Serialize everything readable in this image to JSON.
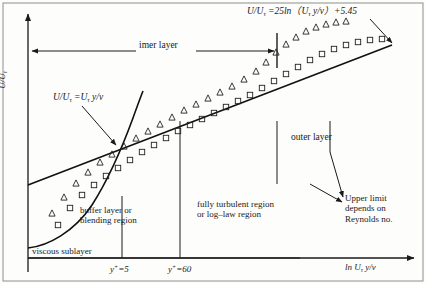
{
  "figure": {
    "axes": {
      "ylabel": "U/U",
      "ylabel_sub": "τ",
      "xlabel_pre": "ln ",
      "xlabel_var": "U",
      "xlabel_sub": "τ",
      "xlabel_post": " y/v"
    },
    "annotations": {
      "eq_log_a": "U/U",
      "eq_log_sub1": "τ",
      "eq_log_b": " =25ln（",
      "eq_log_var": "U",
      "eq_log_sub2": "τ",
      "eq_log_c": " y/v）+5.45",
      "eq_lin_a": "U/U",
      "eq_lin_sub1": "τ",
      "eq_lin_b": " =U",
      "eq_lin_sub2": "τ",
      "eq_lin_c": " y/v",
      "inner_layer": "imer layer",
      "outer_layer": "outer layer",
      "upper_limit_l1": "Upper limit",
      "upper_limit_l2": "depends on",
      "upper_limit_l3": "Reynolds no.",
      "buffer_l1": "buffer layer or",
      "buffer_l2": "blending region",
      "turbulent_l1": "fully turbulent region",
      "turbulent_l2": "or log–law region",
      "viscous_sublayer": "viscous sublayer",
      "tick_y5_pre": "y",
      "tick_y5_sup": "+",
      "tick_y5_post": "=5",
      "tick_y60_pre": "y",
      "tick_y60_sup": "+",
      "tick_y60_post": "=60"
    },
    "colors": {
      "ink": "#1a1a1a",
      "line": "#111111",
      "background": "#fdfdfb",
      "marker_stroke": "#222222"
    }
  },
  "chart_data": {
    "type": "scatter",
    "xlabel": "ln Uτ y/v",
    "ylabel": "U/Uτ",
    "grid": false,
    "legend": "none",
    "axis_note": "Schematic log-linear axes; no numeric tick values shown",
    "region_boundaries": [
      {
        "label": "y+=5",
        "x_px": 122,
        "description": "edge of viscous sublayer / start of buffer layer"
      },
      {
        "label": "y+=60",
        "x_px": 180,
        "description": "end of buffer layer / start of log-law region"
      }
    ],
    "curves": [
      {
        "name": "U/Uτ = Uτ y/v (viscous sublayer curve)",
        "style": "solid",
        "points_px": [
          [
            28,
            247
          ],
          [
            38,
            243
          ],
          [
            50,
            237
          ],
          [
            62,
            228
          ],
          [
            74,
            216
          ],
          [
            86,
            200
          ],
          [
            98,
            181
          ],
          [
            110,
            159
          ],
          [
            120,
            140
          ],
          [
            128,
            123
          ],
          [
            134,
            110
          ],
          [
            139,
            99
          ]
        ]
      },
      {
        "name": "U/Uτ = 25ln(Uτ y/v) + 5.45 (log-law line)",
        "style": "solid-straight",
        "points_px": [
          [
            28,
            185
          ],
          [
            390,
            46
          ]
        ]
      }
    ],
    "series": [
      {
        "name": "triangle-data",
        "marker": "triangle",
        "points_px": [
          [
            52,
            213
          ],
          [
            64,
            197
          ],
          [
            76,
            183
          ],
          [
            88,
            172
          ],
          [
            100,
            162
          ],
          [
            112,
            154
          ],
          [
            124,
            146
          ],
          [
            136,
            138
          ],
          [
            148,
            131
          ],
          [
            160,
            124
          ],
          [
            172,
            117
          ],
          [
            184,
            110
          ],
          [
            196,
            104
          ],
          [
            208,
            98
          ],
          [
            220,
            92
          ],
          [
            232,
            86
          ],
          [
            244,
            79
          ],
          [
            256,
            71
          ],
          [
            266,
            62
          ],
          [
            276,
            52
          ],
          [
            286,
            44
          ],
          [
            296,
            37
          ],
          [
            306,
            31
          ],
          [
            316,
            27
          ],
          [
            326,
            24
          ],
          [
            336,
            22
          ],
          [
            346,
            21
          ]
        ]
      },
      {
        "name": "square-data",
        "marker": "square",
        "points_px": [
          [
            58,
            225
          ],
          [
            70,
            208
          ],
          [
            82,
            195
          ],
          [
            94,
            185
          ],
          [
            106,
            176
          ],
          [
            118,
            168
          ],
          [
            130,
            160
          ],
          [
            142,
            152
          ],
          [
            154,
            145
          ],
          [
            166,
            138
          ],
          [
            178,
            131
          ],
          [
            190,
            125
          ],
          [
            202,
            119
          ],
          [
            214,
            113
          ],
          [
            226,
            107
          ],
          [
            238,
            101
          ],
          [
            250,
            95
          ],
          [
            262,
            88
          ],
          [
            274,
            81
          ],
          [
            286,
            74
          ],
          [
            298,
            67
          ],
          [
            310,
            60
          ],
          [
            322,
            54
          ],
          [
            334,
            49
          ],
          [
            346,
            45
          ],
          [
            358,
            42
          ],
          [
            370,
            40
          ],
          [
            382,
            39
          ]
        ]
      }
    ]
  }
}
